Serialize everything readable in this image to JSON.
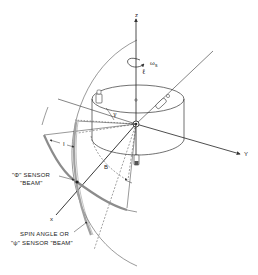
{
  "diagram": {
    "title": "",
    "colors": {
      "line": "#333333",
      "beam": "#9a9a9a",
      "background": "#ffffff"
    },
    "axes": {
      "z": "z",
      "y": "Y",
      "x": "x"
    },
    "symbols": {
      "spin_rate": "ωs",
      "spin_rate_base": "ω",
      "spin_rate_sub": "s",
      "script_l": "ℓ",
      "gamma": "γ",
      "angle_I": "I",
      "angle_B": "B"
    },
    "labels": {
      "phi_sensor_line1": "\"Φ\" SENSOR",
      "phi_sensor_line2": "\"BEAM\"",
      "psi_sensor_line1": "SPIN ANGLE OR",
      "psi_sensor_line2": "\"ψ\" SENSOR \"BEAM\""
    }
  }
}
